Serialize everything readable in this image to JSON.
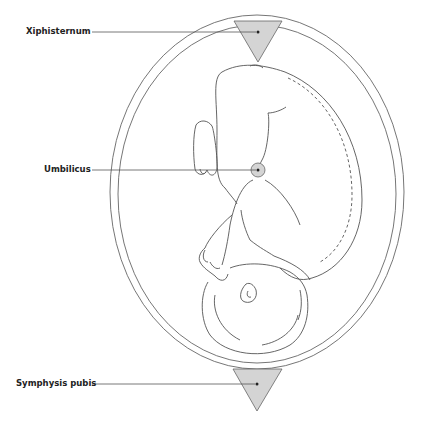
{
  "diagram": {
    "labels": [
      {
        "text": "Xiphisternum",
        "x": 26,
        "y": 26
      },
      {
        "text": "Umbilicus",
        "x": 44,
        "y": 165
      },
      {
        "text": "Symphysis pubis",
        "x": 16,
        "y": 378
      }
    ],
    "colors": {
      "line": "#555555",
      "fill_marker": "#d4d4d4",
      "text": "#222222"
    }
  }
}
